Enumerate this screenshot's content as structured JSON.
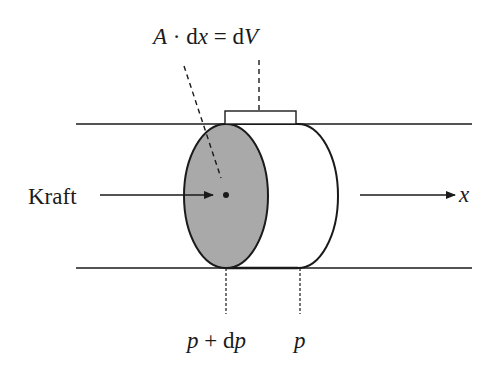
{
  "diagram": {
    "labels": {
      "equation": {
        "A": "A",
        "dot": " · ",
        "d1": "d",
        "x": "x",
        "eq": " = ",
        "d2": "d",
        "V": "V"
      },
      "force": "Kraft",
      "axis": "x",
      "pressure_left": {
        "p": "p",
        "plus": " + ",
        "d": "d",
        "p2": "p"
      },
      "pressure_right": "p"
    },
    "colors": {
      "stroke": "#1a1a1a",
      "face_fill": "#a9a9a9",
      "background": "#ffffff"
    }
  }
}
